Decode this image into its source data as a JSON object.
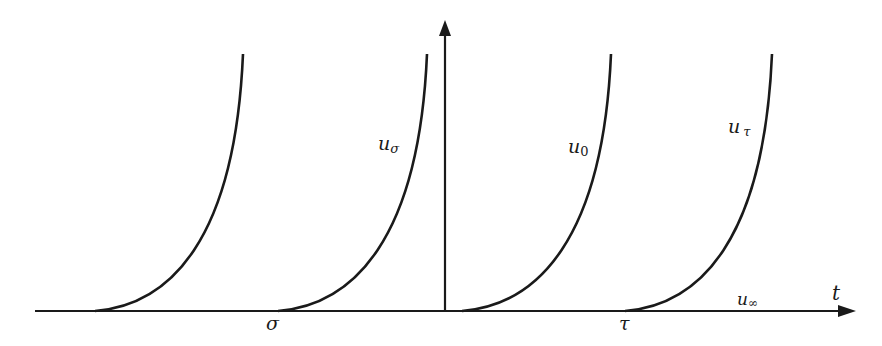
{
  "diagram": {
    "axes": {
      "horizontal_label": "t",
      "vertical_label": ""
    },
    "tick_labels": {
      "sigma": "σ",
      "tau": "τ"
    },
    "curves": [
      {
        "id": "curve-1",
        "label": ""
      },
      {
        "id": "curve-2",
        "label_main": "u",
        "label_sub": "σ"
      },
      {
        "id": "curve-3",
        "label_main": "u",
        "label_sub": "0"
      },
      {
        "id": "curve-4",
        "label_main": "u",
        "label_sub": "τ"
      }
    ],
    "baseline_label": {
      "main": "u",
      "sub": "∞"
    },
    "colors": {
      "line": "#1a1a1a",
      "background": "#ffffff"
    }
  }
}
